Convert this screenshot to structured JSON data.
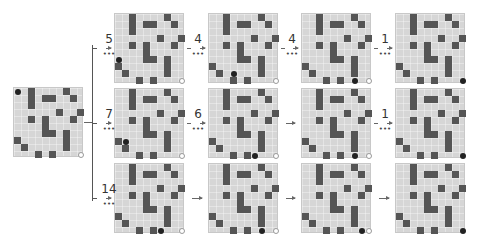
{
  "figure": {
    "grid_size": 10,
    "walls": [
      [
        0,
        2
      ],
      [
        0,
        7
      ],
      [
        1,
        2
      ],
      [
        1,
        4
      ],
      [
        1,
        5
      ],
      [
        1,
        8
      ],
      [
        2,
        2
      ],
      [
        3,
        6
      ],
      [
        3,
        9
      ],
      [
        4,
        2
      ],
      [
        4,
        4
      ],
      [
        4,
        8
      ],
      [
        5,
        4
      ],
      [
        6,
        4
      ],
      [
        6,
        5
      ],
      [
        6,
        7
      ],
      [
        7,
        0
      ],
      [
        7,
        7
      ],
      [
        8,
        1
      ],
      [
        8,
        7
      ],
      [
        9,
        3
      ],
      [
        9,
        5
      ]
    ],
    "goal": [
      9,
      9
    ],
    "initial": {
      "agent": [
        0,
        0
      ]
    },
    "branches": [
      {
        "name": "top",
        "labels": [
          "5",
          "4",
          "4",
          "1"
        ],
        "states": [
          {
            "agent": [
              6,
              0
            ],
            "goal_visible": true
          },
          {
            "agent": [
              8,
              3
            ],
            "goal_visible": true
          },
          {
            "agent": [
              9,
              7
            ],
            "goal_visible": true
          },
          {
            "agent": [
              9,
              9
            ],
            "goal_visible": false
          }
        ]
      },
      {
        "name": "middle",
        "labels": [
          "7",
          "6",
          "",
          "1"
        ],
        "states": [
          {
            "agent": [
              7,
              1
            ],
            "goal_visible": true
          },
          {
            "agent": [
              9,
              6
            ],
            "goal_visible": true
          },
          {
            "agent": [
              9,
              7
            ],
            "goal_visible": true
          },
          {
            "agent": [
              9,
              9
            ],
            "goal_visible": false
          }
        ]
      },
      {
        "name": "bottom",
        "labels": [
          "14",
          "",
          "",
          ""
        ],
        "states": [
          {
            "agent": [
              9,
              6
            ],
            "goal_visible": true
          },
          {
            "agent": [
              9,
              7
            ],
            "goal_visible": true
          },
          {
            "agent": [
              9,
              8
            ],
            "goal_visible": true
          },
          {
            "agent": [
              9,
              9
            ],
            "goal_visible": false
          }
        ]
      }
    ],
    "dots_symbol": "•••"
  }
}
